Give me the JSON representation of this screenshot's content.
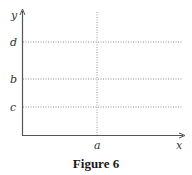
{
  "figure": {
    "caption": "Figure 6",
    "axes": {
      "x_label": "x",
      "y_label": "y"
    },
    "horizontal_guides": [
      {
        "label": "d",
        "y": 42
      },
      {
        "label": "b",
        "y": 79
      },
      {
        "label": "c",
        "y": 107
      }
    ],
    "vertical_guides": [
      {
        "label": "a",
        "x": 97
      }
    ],
    "colors": {
      "axis": "#555555",
      "guide": "#888888",
      "text": "#333333"
    }
  }
}
